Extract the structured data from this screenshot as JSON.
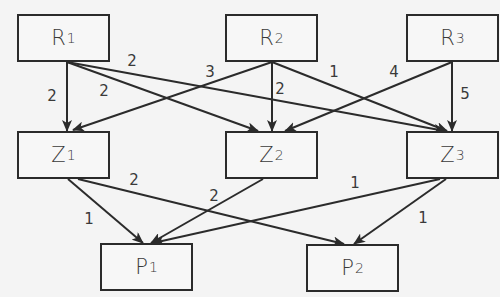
{
  "colors": {
    "background": "#f4f4f4",
    "stroke": "#2b2b2b",
    "text": "#3a3a3a"
  },
  "nodes": [
    {
      "id": "R1",
      "base": "R",
      "sub": "1",
      "x": 17,
      "y": 14,
      "w": 93,
      "h": 48
    },
    {
      "id": "R2",
      "base": "R",
      "sub": "2",
      "x": 225,
      "y": 14,
      "w": 93,
      "h": 48
    },
    {
      "id": "R3",
      "base": "R",
      "sub": "3",
      "x": 406,
      "y": 14,
      "w": 93,
      "h": 48
    },
    {
      "id": "Z1",
      "base": "Z",
      "sub": "1",
      "x": 17,
      "y": 131,
      "w": 93,
      "h": 48
    },
    {
      "id": "Z2",
      "base": "Z",
      "sub": "2",
      "x": 225,
      "y": 131,
      "w": 93,
      "h": 48
    },
    {
      "id": "Z3",
      "base": "Z",
      "sub": "3",
      "x": 406,
      "y": 131,
      "w": 93,
      "h": 48
    },
    {
      "id": "P1",
      "base": "P",
      "sub": "1",
      "x": 100,
      "y": 243,
      "w": 93,
      "h": 48
    },
    {
      "id": "P2",
      "base": "P",
      "sub": "2",
      "x": 306,
      "y": 244,
      "w": 93,
      "h": 48
    }
  ],
  "edges": [
    {
      "from": "R1",
      "to": "Z1",
      "weight": "2",
      "x1": 67,
      "y1": 62,
      "x2": 67,
      "y2": 131,
      "lx": 52,
      "ly": 96
    },
    {
      "from": "R1",
      "to": "Z2",
      "weight": "2",
      "x1": 67,
      "y1": 62,
      "x2": 258,
      "y2": 131,
      "lx": 104,
      "ly": 91
    },
    {
      "from": "R1",
      "to": "Z3",
      "weight": "2",
      "x1": 67,
      "y1": 62,
      "x2": 445,
      "y2": 131,
      "lx": 132,
      "ly": 61
    },
    {
      "from": "R2",
      "to": "Z1",
      "weight": "3",
      "x1": 272,
      "y1": 62,
      "x2": 73,
      "y2": 130,
      "lx": 210,
      "ly": 72
    },
    {
      "from": "R2",
      "to": "Z2",
      "weight": "2",
      "x1": 272,
      "y1": 62,
      "x2": 272,
      "y2": 131,
      "lx": 280,
      "ly": 89
    },
    {
      "from": "R2",
      "to": "Z3",
      "weight": "1",
      "x1": 272,
      "y1": 62,
      "x2": 447,
      "y2": 131,
      "lx": 334,
      "ly": 72
    },
    {
      "from": "R3",
      "to": "Z2",
      "weight": "4",
      "x1": 452,
      "y1": 62,
      "x2": 285,
      "y2": 131,
      "lx": 394,
      "ly": 72
    },
    {
      "from": "R3",
      "to": "Z3",
      "weight": "5",
      "x1": 452,
      "y1": 62,
      "x2": 452,
      "y2": 131,
      "lx": 465,
      "ly": 94
    },
    {
      "from": "Z1",
      "to": "P1",
      "weight": "1",
      "x1": 68,
      "y1": 179,
      "x2": 143,
      "y2": 243,
      "lx": 89,
      "ly": 219
    },
    {
      "from": "Z1",
      "to": "P2",
      "weight": "2",
      "x1": 78,
      "y1": 179,
      "x2": 344,
      "y2": 244,
      "lx": 134,
      "ly": 180
    },
    {
      "from": "Z2",
      "to": "P1",
      "weight": "2",
      "x1": 263,
      "y1": 179,
      "x2": 151,
      "y2": 243,
      "lx": 214,
      "ly": 196
    },
    {
      "from": "Z3",
      "to": "P1",
      "weight": "1",
      "x1": 440,
      "y1": 179,
      "x2": 153,
      "y2": 243,
      "lx": 355,
      "ly": 183
    },
    {
      "from": "Z3",
      "to": "P2",
      "weight": "1",
      "x1": 446,
      "y1": 179,
      "x2": 354,
      "y2": 244,
      "lx": 423,
      "ly": 218
    }
  ]
}
